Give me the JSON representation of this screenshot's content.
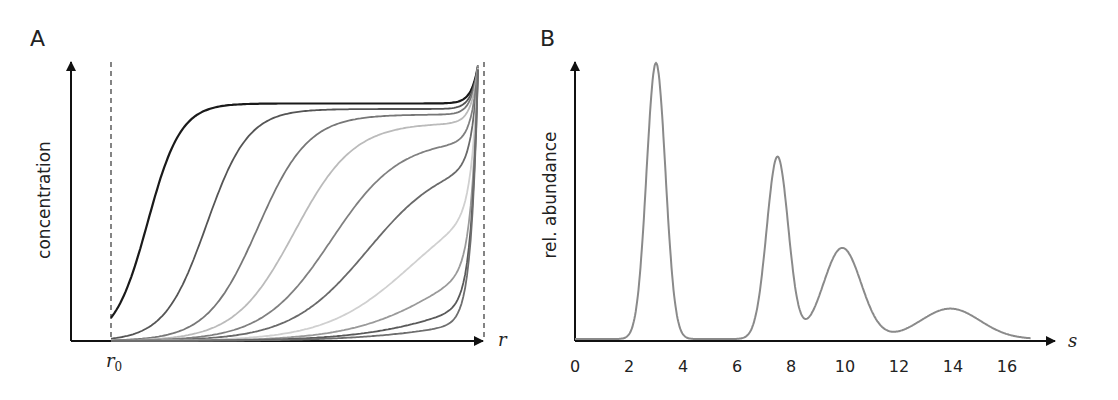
{
  "panels": {
    "a": {
      "letter": "A",
      "ylabel": "concentration",
      "xlabel": "r",
      "r0_label": "r",
      "r0_sub": "0"
    },
    "b": {
      "letter": "B",
      "ylabel": "rel. abundance",
      "xlabel": "s",
      "ticks": [
        "0",
        "2",
        "4",
        "6",
        "8",
        "10",
        "12",
        "14",
        "16"
      ]
    }
  },
  "chart_data": [
    {
      "type": "line",
      "title": "A",
      "xlabel": "r",
      "ylabel": "concentration",
      "annotations": [
        "r0 (meniscus, dashed line)",
        "cell bottom (dashed line)"
      ],
      "description": "Sedimentation boundary profiles at successive times; sigmoidal boundaries move from r0 toward the cell bottom, plateau decreasing over time, steep rise at the bottom",
      "series": [
        {
          "name": "t1",
          "color": "#1a1a1a",
          "midpoint_frac": 0.1,
          "plateau_frac": 0.86
        },
        {
          "name": "t2",
          "color": "#555555",
          "midpoint_frac": 0.26,
          "plateau_frac": 0.84
        },
        {
          "name": "t3",
          "color": "#777777",
          "midpoint_frac": 0.4,
          "plateau_frac": 0.82
        },
        {
          "name": "t4",
          "color": "#bbbbbb",
          "midpoint_frac": 0.5,
          "plateau_frac": 0.79
        },
        {
          "name": "t5",
          "color": "#808080",
          "midpoint_frac": 0.6,
          "plateau_frac": 0.73
        },
        {
          "name": "t6",
          "color": "#6a6a6a",
          "midpoint_frac": 0.7,
          "plateau_frac": 0.66
        },
        {
          "name": "t7",
          "color": "#d0d0d0",
          "midpoint_frac": 0.82,
          "plateau_frac": 0.55
        },
        {
          "name": "t8",
          "color": "#9a9a9a",
          "midpoint_frac": 0.92,
          "plateau_frac": 0.4
        },
        {
          "name": "t9",
          "color": "#5a5a5a",
          "midpoint_frac": 0.98,
          "plateau_frac": 0.25
        },
        {
          "name": "t10",
          "color": "#6e6e6e",
          "midpoint_frac": 1.02,
          "plateau_frac": 0.15
        }
      ]
    },
    {
      "type": "line",
      "title": "B",
      "xlabel": "s",
      "ylabel": "rel. abundance",
      "xlim": [
        0,
        17
      ],
      "xticks": [
        0,
        2,
        4,
        6,
        8,
        10,
        12,
        14,
        16
      ],
      "peaks": [
        {
          "s": 3.0,
          "height": 1.0,
          "width": 0.35
        },
        {
          "s": 7.5,
          "height": 0.66,
          "width": 0.4
        },
        {
          "s": 9.9,
          "height": 0.33,
          "width": 0.7
        },
        {
          "s": 13.9,
          "height": 0.11,
          "width": 1.1
        }
      ],
      "line_color": "#8a8a8a"
    }
  ]
}
